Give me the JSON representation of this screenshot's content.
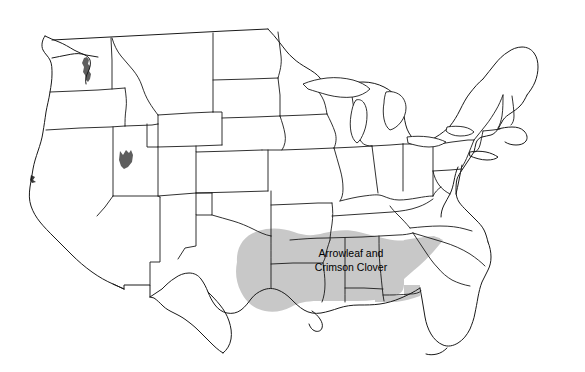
{
  "map": {
    "title": "Arrowleaf and Crimson Clover distribution map of the contiguous United States",
    "background_color": "#ffffff",
    "outline_color": "#1a1a1a",
    "shade_color": "#c8c8c8",
    "label_color": "#000000",
    "regions": [
      {
        "id": "southeast-clover-region",
        "name": "Arrowleaf and Crimson Clover adaptation area",
        "label_line_1": "Arrowleaf and",
        "label_line_2": "Crimson Clover",
        "fill": "#c8c8c8",
        "label_x": 351,
        "label_y_line_1": 257,
        "label_y_line_2": 271,
        "states_covered": [
          "East Texas",
          "Oklahoma",
          "Arkansas",
          "Louisiana",
          "Mississippi",
          "Alabama",
          "Georgia",
          "South Carolina",
          "North Florida",
          "Southern Tennessee"
        ]
      },
      {
        "id": "utah-patch",
        "name": "Utah isolated patch",
        "fill": "#6b6b6b",
        "label_line_1": "",
        "label_line_2": ""
      },
      {
        "id": "washington-patch",
        "name": "Western Washington isolated patch",
        "fill": "#6b6b6b",
        "label_line_1": "",
        "label_line_2": ""
      }
    ],
    "legend_text": "Arrowleaf and Crimson Clover"
  }
}
